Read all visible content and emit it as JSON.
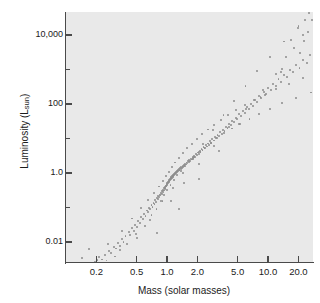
{
  "figure": {
    "background": "#ffffff",
    "plot_background": "#e9e9e9",
    "axis_color": "#4a4a4a",
    "point_color": "#8d8d8d"
  },
  "axis_titles": {
    "x": "Mass (solar masses)",
    "y_prefix": "Luminosity (L",
    "y_sub": "sun",
    "y_suffix": ")"
  },
  "chart_data": {
    "type": "scatter",
    "title": "",
    "xlabel": "Mass (solar masses)",
    "ylabel": "Luminosity (L_sun)",
    "xscale": "log",
    "yscale": "log",
    "xlim": [
      0.1,
      30
    ],
    "ylim": [
      0.0001,
      3000000
    ],
    "grid": false,
    "legend": null,
    "xticks": [
      0.2,
      0.5,
      1.0,
      2.0,
      5.0,
      10.0,
      20.0
    ],
    "xticklabels": [
      "0.2",
      "0.5",
      "1.0",
      "2.0",
      "5.0",
      "10.0",
      "20.0"
    ],
    "yticks": [
      0.01,
      1.0,
      100,
      10000,
      1000000
    ],
    "yticklabels": [
      "0.01",
      "1.0",
      "100",
      "10,000",
      "1,000,000"
    ],
    "yminorticks": [
      0.1,
      10,
      1000,
      100000,
      0.001
    ],
    "relation": "L proportional to M^3.5 (main sequence mass-luminosity relation)",
    "points": [
      [
        0.118,
        0.00032
      ],
      [
        0.125,
        0.00052
      ],
      [
        0.138,
        0.0012
      ],
      [
        0.152,
        0.00085
      ],
      [
        0.168,
        0.0017
      ],
      [
        0.175,
        0.0021
      ],
      [
        0.192,
        0.0026
      ],
      [
        0.205,
        0.003
      ],
      [
        0.214,
        0.0036
      ],
      [
        0.228,
        0.0031
      ],
      [
        0.243,
        0.0042
      ],
      [
        0.252,
        0.0029
      ],
      [
        0.268,
        0.0055
      ],
      [
        0.281,
        0.0048
      ],
      [
        0.296,
        0.0072
      ],
      [
        0.312,
        0.0065
      ],
      [
        0.327,
        0.0091
      ],
      [
        0.342,
        0.0077
      ],
      [
        0.356,
        0.012
      ],
      [
        0.371,
        0.0102
      ],
      [
        0.388,
        0.015
      ],
      [
        0.402,
        0.0021
      ],
      [
        0.418,
        0.019
      ],
      [
        0.433,
        0.016
      ],
      [
        0.452,
        0.025
      ],
      [
        0.468,
        0.021
      ],
      [
        0.486,
        0.032
      ],
      [
        0.502,
        0.028
      ],
      [
        0.521,
        0.041
      ],
      [
        0.539,
        0.036
      ],
      [
        0.556,
        0.052
      ],
      [
        0.574,
        0.046
      ],
      [
        0.592,
        0.066
      ],
      [
        0.612,
        0.058
      ],
      [
        0.631,
        0.082
      ],
      [
        0.648,
        0.073
      ],
      [
        0.667,
        0.098
      ],
      [
        0.685,
        0.088
      ],
      [
        0.702,
        0.118
      ],
      [
        0.718,
        0.105
      ],
      [
        0.736,
        0.138
      ],
      [
        0.752,
        0.125
      ],
      [
        0.768,
        0.162
      ],
      [
        0.781,
        0.148
      ],
      [
        0.795,
        0.185
      ],
      [
        0.808,
        0.172
      ],
      [
        0.822,
        0.212
      ],
      [
        0.836,
        0.198
      ],
      [
        0.848,
        0.238
      ],
      [
        0.861,
        0.222
      ],
      [
        0.874,
        0.268
      ],
      [
        0.886,
        0.252
      ],
      [
        0.898,
        0.298
      ],
      [
        0.908,
        0.282
      ],
      [
        0.918,
        0.328
      ],
      [
        0.928,
        0.312
      ],
      [
        0.938,
        0.358
      ],
      [
        0.946,
        0.342
      ],
      [
        0.955,
        0.392
      ],
      [
        0.963,
        0.372
      ],
      [
        0.972,
        0.428
      ],
      [
        0.98,
        0.408
      ],
      [
        0.988,
        0.462
      ],
      [
        0.995,
        0.442
      ],
      [
        1.002,
        0.498
      ],
      [
        1.01,
        0.478
      ],
      [
        1.018,
        0.535
      ],
      [
        1.026,
        0.512
      ],
      [
        1.034,
        0.572
      ],
      [
        1.042,
        0.548
      ],
      [
        1.05,
        0.612
      ],
      [
        1.058,
        0.588
      ],
      [
        1.068,
        0.655
      ],
      [
        1.076,
        0.628
      ],
      [
        1.086,
        0.702
      ],
      [
        1.095,
        0.672
      ],
      [
        1.105,
        0.748
      ],
      [
        1.115,
        0.718
      ],
      [
        1.126,
        0.802
      ],
      [
        1.136,
        0.768
      ],
      [
        1.148,
        0.858
      ],
      [
        1.158,
        0.822
      ],
      [
        1.17,
        0.918
      ],
      [
        1.182,
        0.878
      ],
      [
        1.195,
        0.982
      ],
      [
        1.208,
        0.938
      ],
      [
        1.222,
        1.05
      ],
      [
        1.235,
        1.0
      ],
      [
        1.25,
        1.12
      ],
      [
        1.265,
        1.07
      ],
      [
        1.281,
        1.2
      ],
      [
        1.296,
        1.14
      ],
      [
        1.312,
        1.28
      ],
      [
        1.33,
        1.22
      ],
      [
        1.348,
        1.38
      ],
      [
        1.366,
        1.31
      ],
      [
        1.385,
        1.48
      ],
      [
        1.404,
        1.41
      ],
      [
        1.424,
        1.59
      ],
      [
        1.445,
        1.51
      ],
      [
        1.466,
        1.72
      ],
      [
        1.488,
        1.63
      ],
      [
        1.512,
        1.86
      ],
      [
        1.535,
        1.76
      ],
      [
        1.56,
        2.02
      ],
      [
        1.586,
        1.91
      ],
      [
        1.612,
        2.2
      ],
      [
        1.64,
        2.08
      ],
      [
        1.668,
        2.4
      ],
      [
        1.698,
        2.26
      ],
      [
        1.728,
        2.62
      ],
      [
        1.76,
        2.47
      ],
      [
        1.792,
        2.88
      ],
      [
        1.826,
        2.7
      ],
      [
        1.862,
        3.18
      ],
      [
        1.898,
        2.98
      ],
      [
        1.936,
        3.52
      ],
      [
        1.975,
        3.3
      ],
      [
        2.015,
        3.92
      ],
      [
        2.058,
        3.66
      ],
      [
        2.102,
        4.38
      ],
      [
        2.148,
        4.08
      ],
      [
        2.196,
        4.92
      ],
      [
        2.246,
        4.58
      ],
      [
        2.298,
        5.55
      ],
      [
        2.352,
        5.16
      ],
      [
        2.41,
        6.3
      ],
      [
        2.47,
        5.85
      ],
      [
        2.532,
        7.18
      ],
      [
        2.598,
        6.65
      ],
      [
        2.668,
        8.22
      ],
      [
        2.74,
        7.6
      ],
      [
        2.816,
        9.48
      ],
      [
        2.896,
        8.72
      ],
      [
        2.98,
        11.0
      ],
      [
        3.068,
        10.1
      ],
      [
        3.162,
        12.9
      ],
      [
        3.26,
        11.8
      ],
      [
        3.364,
        15.2
      ],
      [
        3.472,
        13.9
      ],
      [
        3.588,
        18.1
      ],
      [
        3.708,
        16.5
      ],
      [
        3.836,
        21.8
      ],
      [
        3.972,
        19.8
      ],
      [
        4.116,
        26.5
      ],
      [
        4.268,
        24.0
      ],
      [
        4.43,
        32.5
      ],
      [
        4.6,
        29.3
      ],
      [
        4.782,
        40.2
      ],
      [
        4.975,
        36.2
      ],
      [
        5.18,
        50.2
      ],
      [
        5.398,
        45.0
      ],
      [
        5.63,
        63.0
      ],
      [
        5.876,
        56.3
      ],
      [
        6.14,
        79.5
      ],
      [
        6.42,
        71.0
      ],
      [
        6.72,
        101
      ],
      [
        7.042,
        90.0
      ],
      [
        7.386,
        130
      ],
      [
        7.756,
        115
      ],
      [
        8.152,
        168
      ],
      [
        8.578,
        148
      ],
      [
        9.038,
        220
      ],
      [
        9.532,
        192
      ],
      [
        10.07,
        290
      ],
      [
        10.65,
        252
      ],
      [
        11.28,
        385
      ],
      [
        11.96,
        334
      ],
      [
        12.71,
        515
      ],
      [
        13.52,
        445
      ],
      [
        14.42,
        700
      ],
      [
        15.4,
        602
      ],
      [
        16.48,
        960
      ],
      [
        17.68,
        822
      ],
      [
        19.02,
        1330
      ],
      [
        20.52,
        1135
      ],
      [
        22.2,
        1860
      ],
      [
        24.1,
        1580
      ],
      [
        26.25,
        2620
      ],
      [
        0.168,
        0.0062
      ],
      [
        0.205,
        0.0015
      ],
      [
        0.262,
        0.0088
      ],
      [
        0.308,
        0.0038
      ],
      [
        0.355,
        0.0205
      ],
      [
        0.404,
        0.0088
      ],
      [
        0.452,
        0.048
      ],
      [
        0.505,
        0.0128
      ],
      [
        0.556,
        0.095
      ],
      [
        0.606,
        0.0295
      ],
      [
        0.655,
        0.168
      ],
      [
        0.702,
        0.062
      ],
      [
        0.748,
        0.262
      ],
      [
        0.788,
        0.0905
      ],
      [
        0.832,
        0.405
      ],
      [
        0.868,
        0.152
      ],
      [
        0.905,
        0.575
      ],
      [
        0.938,
        0.228
      ],
      [
        0.972,
        0.795
      ],
      [
        1.005,
        0.318
      ],
      [
        1.042,
        1.08
      ],
      [
        1.082,
        0.445
      ],
      [
        1.122,
        1.48
      ],
      [
        1.165,
        0.615
      ],
      [
        1.212,
        2.02
      ],
      [
        1.262,
        0.852
      ],
      [
        1.318,
        2.78
      ],
      [
        1.378,
        1.16
      ],
      [
        1.442,
        3.78
      ],
      [
        1.512,
        1.58
      ],
      [
        1.588,
        5.15
      ],
      [
        1.672,
        2.15
      ],
      [
        1.762,
        7.05
      ],
      [
        1.862,
        2.92
      ],
      [
        1.972,
        9.65
      ],
      [
        2.092,
        3.98
      ],
      [
        2.225,
        13.2
      ],
      [
        2.372,
        5.42
      ],
      [
        2.535,
        18.2
      ],
      [
        2.715,
        7.42
      ],
      [
        2.918,
        25.2
      ],
      [
        3.145,
        10.2
      ],
      [
        3.402,
        35.0
      ],
      [
        3.692,
        14.1
      ],
      [
        4.022,
        48.5
      ],
      [
        4.398,
        19.5
      ],
      [
        4.828,
        67.5
      ],
      [
        5.322,
        27.0
      ],
      [
        5.892,
        94.0
      ],
      [
        6.552,
        37.5
      ],
      [
        7.322,
        132
      ],
      [
        8.222,
        52.0
      ],
      [
        9.282,
        186
      ],
      [
        10.54,
        73.0
      ],
      [
        12.05,
        265
      ],
      [
        13.88,
        104
      ],
      [
        16.12,
        380
      ],
      [
        18.9,
        149
      ],
      [
        22.4,
        555
      ],
      [
        26.85,
        215
      ],
      [
        0.145,
        0.0035
      ],
      [
        0.222,
        0.0019
      ],
      [
        0.34,
        0.0058
      ],
      [
        0.492,
        0.0168
      ],
      [
        0.683,
        0.0425
      ],
      [
        0.902,
        0.158
      ],
      [
        1.152,
        0.362
      ],
      [
        1.455,
        1.02
      ],
      [
        1.822,
        2.48
      ],
      [
        2.28,
        7.05
      ],
      [
        2.865,
        17.2
      ],
      [
        3.622,
        47.0
      ],
      [
        4.625,
        122
      ],
      [
        5.985,
        335
      ],
      [
        7.862,
        880
      ],
      [
        10.52,
        2350
      ],
      [
        14.35,
        6500
      ],
      [
        20.05,
        18500
      ],
      [
        0.62,
        0.00055
      ],
      [
        1.068,
        0.00092
      ],
      [
        5.685,
        0.0024
      ],
      [
        0.79,
        0.0185
      ],
      [
        1.325,
        0.092
      ],
      [
        2.085,
        0.685
      ],
      [
        3.285,
        4.25
      ],
      [
        5.21,
        26.5
      ],
      [
        8.42,
        162
      ],
      [
        13.85,
        1020
      ],
      [
        22.95,
        6800
      ],
      [
        1.095,
        0.152
      ],
      [
        1.485,
        0.512
      ],
      [
        2.062,
        1.78
      ],
      [
        2.905,
        6.1
      ],
      [
        4.145,
        21.0
      ],
      [
        6.02,
        72.5
      ],
      [
        8.925,
        252
      ],
      [
        13.52,
        870
      ],
      [
        20.95,
        3020
      ],
      [
        24.85,
        12500
      ],
      [
        27.5,
        28000
      ],
      [
        25.6,
        44000
      ],
      [
        22.1,
        9800
      ],
      [
        18.25,
        4100
      ],
      [
        15.05,
        2250
      ],
      [
        12.02,
        760
      ],
      [
        16.85,
        7300
      ],
      [
        19.65,
        15500
      ],
      [
        23.4,
        26500
      ],
      [
        26.1,
        58000
      ]
    ]
  }
}
